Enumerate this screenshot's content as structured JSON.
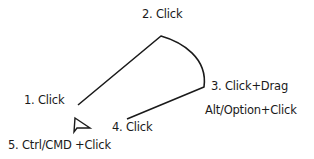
{
  "diagram": {
    "type": "pen-tool-path-steps",
    "labels": {
      "step1": "1. Click",
      "step2": "2. Click",
      "step3": "3. Click+Drag",
      "step3_alt": "Alt/Option+Click",
      "step4": "4. Click",
      "step5": "5. Ctrl/CMD +Click"
    },
    "points": {
      "p1": [
        78,
        105
      ],
      "p2": [
        161,
        36
      ],
      "p3": [
        204,
        87
      ],
      "p4": [
        127,
        119
      ]
    },
    "icon": "pen-cursor-arrow-icon",
    "stroke_color": "#1a1a1a",
    "background": "#ffffff"
  }
}
